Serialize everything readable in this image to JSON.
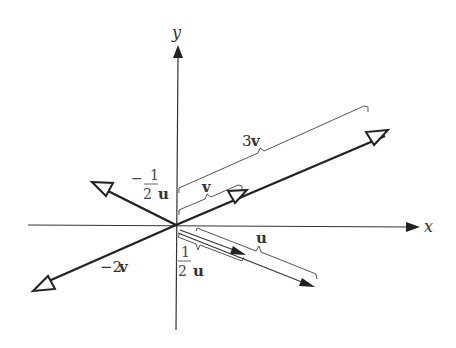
{
  "diagram": {
    "type": "vector-scalar-multiples",
    "axes": {
      "x_label": "x",
      "y_label": "y"
    },
    "vectors": [
      {
        "name": "3v",
        "label": "3v",
        "style": "thick-open-arrow"
      },
      {
        "name": "v",
        "label": "v",
        "style": "thick-open-arrow-midpoint"
      },
      {
        "name": "-2v",
        "label": "−2v",
        "style": "thick-open-arrow"
      },
      {
        "name": "-1/2u",
        "label_sign": "−",
        "label_num": "1",
        "label_den": "2",
        "label_vec": "u",
        "style": "thick-open-arrow"
      },
      {
        "name": "u",
        "label": "u",
        "style": "thin-solid-arrow"
      },
      {
        "name": "1/2u",
        "label_num": "1",
        "label_den": "2",
        "label_vec": "u",
        "style": "thin-solid-arrow"
      }
    ],
    "labels": {
      "three_v_num": "3",
      "three_v_vec": "v",
      "v": "v",
      "neg_two_v_num": "−2",
      "neg_two_v_vec": "v",
      "neg_half_sign": "−",
      "neg_half_num": "1",
      "neg_half_den": "2",
      "neg_half_vec": "u",
      "half_num": "1",
      "half_den": "2",
      "half_vec": "u",
      "u": "u"
    },
    "colors": {
      "ink": "#222222",
      "background": "#ffffff"
    }
  }
}
